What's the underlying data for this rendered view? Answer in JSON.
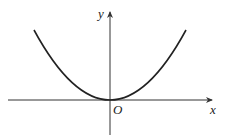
{
  "diagram": {
    "title": "",
    "axes": {
      "x_label": "x",
      "y_label": "y",
      "origin_label": "O"
    },
    "curve": {
      "type": "parabola",
      "description": "Upward-opening parabola with vertex at origin",
      "vertex": [
        0,
        0
      ]
    },
    "colors": {
      "axis": "#333333",
      "curve": "#222222",
      "background": "#ffffff"
    }
  }
}
